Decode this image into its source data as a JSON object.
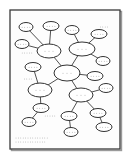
{
  "diagram": {
    "type": "concept-map",
    "frame": {
      "x": 10,
      "y": 10,
      "w": 110,
      "h": 139,
      "border_color": "#3a3a3a",
      "background": "#fdfdfd"
    },
    "colors": {
      "node_stroke": "#333333",
      "edge": "#3c3c3c",
      "placeholder_text": "#8a8a8a"
    },
    "nodes": [
      {
        "id": "A",
        "cx": 26,
        "cy": 27,
        "rx": 7,
        "ry": 4.5,
        "label": "· · · ·",
        "size": "small"
      },
      {
        "id": "B",
        "cx": 51,
        "cy": 26,
        "rx": 8,
        "ry": 4.5,
        "label": "· · · ·",
        "size": "small"
      },
      {
        "id": "C",
        "cx": 72,
        "cy": 30,
        "rx": 7,
        "ry": 4.5,
        "label": "· · · ·",
        "size": "small"
      },
      {
        "id": "D",
        "cx": 99,
        "cy": 34,
        "rx": 8,
        "ry": 4.5,
        "label": "· · · ·",
        "size": "small"
      },
      {
        "id": "E",
        "cx": 22,
        "cy": 44,
        "rx": 7,
        "ry": 4.5,
        "label": "· · · ·",
        "size": "small"
      },
      {
        "id": "F",
        "cx": 49,
        "cy": 51,
        "rx": 12,
        "ry": 7,
        "label": "· · ·",
        "size": "medium"
      },
      {
        "id": "G",
        "cx": 82,
        "cy": 49,
        "rx": 13,
        "ry": 7,
        "label": "· · ·",
        "size": "medium"
      },
      {
        "id": "H",
        "cx": 103,
        "cy": 61,
        "rx": 7,
        "ry": 4.5,
        "label": "· · · ·",
        "size": "small"
      },
      {
        "id": "I",
        "cx": 33,
        "cy": 67,
        "rx": 8,
        "ry": 4.5,
        "label": "· · · ·",
        "size": "small"
      },
      {
        "id": "J",
        "cx": 67,
        "cy": 73,
        "rx": 13,
        "ry": 8,
        "label": "· · ·",
        "size": "central"
      },
      {
        "id": "K",
        "cx": 95,
        "cy": 76,
        "rx": 8,
        "ry": 4.5,
        "label": "· · · ·",
        "size": "small"
      },
      {
        "id": "L",
        "cx": 40,
        "cy": 90,
        "rx": 12,
        "ry": 7,
        "label": "· · ·",
        "size": "medium"
      },
      {
        "id": "M",
        "cx": 106,
        "cy": 88,
        "rx": 7,
        "ry": 4.5,
        "label": "· · · ·",
        "size": "small"
      },
      {
        "id": "N",
        "cx": 81,
        "cy": 95,
        "rx": 12,
        "ry": 7,
        "label": "· · ·",
        "size": "medium"
      },
      {
        "id": "O",
        "cx": 41,
        "cy": 108,
        "rx": 8,
        "ry": 4.5,
        "label": "· · · ·",
        "size": "small"
      },
      {
        "id": "P",
        "cx": 69,
        "cy": 116,
        "rx": 8,
        "ry": 4.5,
        "label": "· · · ·",
        "size": "small"
      },
      {
        "id": "Q",
        "cx": 98,
        "cy": 113,
        "rx": 8,
        "ry": 4.5,
        "label": "· · · ·",
        "size": "small"
      },
      {
        "id": "R",
        "cx": 29,
        "cy": 122,
        "rx": 7,
        "ry": 4.5,
        "label": "· · · ·",
        "size": "small"
      },
      {
        "id": "S",
        "cx": 71,
        "cy": 132,
        "rx": 7,
        "ry": 4.5,
        "label": "· · · ·",
        "size": "small"
      },
      {
        "id": "T",
        "cx": 104,
        "cy": 127,
        "rx": 8,
        "ry": 4.5,
        "label": "· · · ·",
        "size": "small"
      }
    ],
    "edges": [
      [
        "A",
        "F"
      ],
      [
        "B",
        "F"
      ],
      [
        "E",
        "F"
      ],
      [
        "F",
        "J"
      ],
      [
        "C",
        "G"
      ],
      [
        "D",
        "G"
      ],
      [
        "H",
        "G"
      ],
      [
        "G",
        "J"
      ],
      [
        "J",
        "K"
      ],
      [
        "J",
        "L"
      ],
      [
        "I",
        "L"
      ],
      [
        "L",
        "O"
      ],
      [
        "O",
        "R"
      ],
      [
        "J",
        "N"
      ],
      [
        "M",
        "N"
      ],
      [
        "N",
        "P"
      ],
      [
        "P",
        "S"
      ],
      [
        "N",
        "Q"
      ],
      [
        "Q",
        "T"
      ]
    ],
    "annotations": [
      {
        "x": 104,
        "y": 27,
        "text": "· · · ·"
      },
      {
        "x": 27,
        "y": 53,
        "text": "· · · · ·"
      },
      {
        "x": 28,
        "y": 79,
        "text": "· · · ·"
      },
      {
        "x": 50,
        "y": 116,
        "text": "· · · · ·"
      }
    ],
    "footer_lines": [
      "· · · · · · · · · · · · · ·",
      "· · · · · · · · · · · · ·"
    ]
  }
}
